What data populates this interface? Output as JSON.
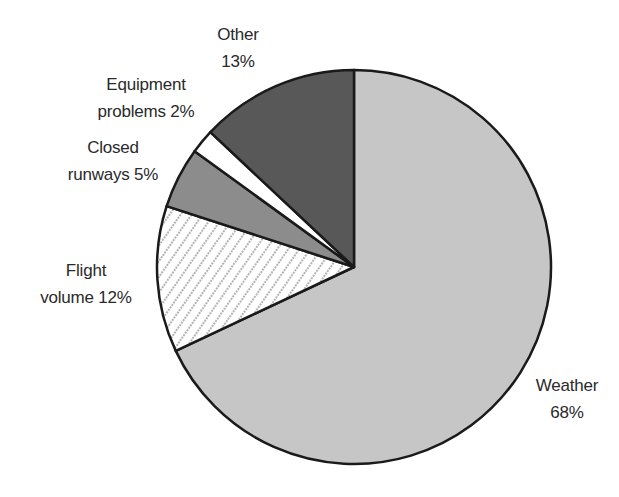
{
  "chart_data": {
    "type": "pie",
    "title": "",
    "start_angle_deg": 0,
    "direction": "clockwise",
    "slices": [
      {
        "label": "Weather",
        "value": 68,
        "label_lines": [
          "Weather",
          "68%"
        ],
        "fill": "#c6c6c6",
        "pattern": "none"
      },
      {
        "label": "Flight volume",
        "value": 12,
        "label_lines": [
          "Flight",
          "volume 12%"
        ],
        "fill": "#ffffff",
        "pattern": "diagonal-dots"
      },
      {
        "label": "Closed runways",
        "value": 5,
        "label_lines": [
          "Closed",
          "runways 5%"
        ],
        "fill": "#8c8c8c",
        "pattern": "none"
      },
      {
        "label": "Equipment problems",
        "value": 2,
        "label_lines": [
          "Equipment",
          "problems 2%"
        ],
        "fill": "#ffffff",
        "pattern": "none"
      },
      {
        "label": "Other",
        "value": 13,
        "label_lines": [
          "Other",
          "13%"
        ],
        "fill": "#585858",
        "pattern": "none"
      }
    ],
    "categories": [
      "Weather",
      "Flight volume",
      "Closed runways",
      "Equipment problems",
      "Other"
    ],
    "values": [
      68,
      12,
      5,
      2,
      13
    ],
    "unit": "%",
    "legend": "none (direct labels)"
  },
  "labels": {
    "weather": {
      "line1": "Weather",
      "line2": "68%"
    },
    "flight": {
      "line1": "Flight",
      "line2": "volume 12%"
    },
    "closed": {
      "line1": "Closed",
      "line2": "runways 5%"
    },
    "equipment": {
      "line1": "Equipment",
      "line2": "problems 2%"
    },
    "other": {
      "line1": "Other",
      "line2": "13%"
    }
  }
}
